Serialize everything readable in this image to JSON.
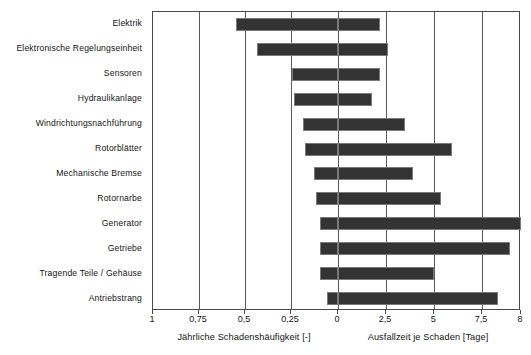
{
  "chart_data": {
    "type": "bar",
    "subtype": "bidirectional-horizontal-bar",
    "title": "",
    "categories": [
      "Elektrik",
      "Elektronische Regelungseinheit",
      "Sensoren",
      "Hydraulikanlage",
      "Windrichtungsnachführung",
      "Rotorblätter",
      "Mechanische Bremse",
      "Rotornarbe",
      "Generator",
      "Getriebe",
      "Tragende Teile / Gehäuse",
      "Antriebstrang"
    ],
    "series": [
      {
        "name": "Jährliche Schadenshäufigkeit [-]",
        "direction": "left",
        "axis_range": [
          1,
          0
        ],
        "axis_ticks": [
          1,
          0.75,
          0.5,
          0.25,
          0
        ],
        "axis_tick_labels": [
          "1",
          "0,75",
          "0,5",
          "0,25",
          "0"
        ],
        "values": [
          0.55,
          0.44,
          0.25,
          0.24,
          0.19,
          0.18,
          0.13,
          0.12,
          0.1,
          0.1,
          0.1,
          0.06
        ]
      },
      {
        "name": "Ausfallzeit je Schaden [Tage]",
        "direction": "right",
        "axis_range": [
          0,
          8
        ],
        "axis_ticks": [
          0,
          2.5,
          5,
          7.5,
          8
        ],
        "axis_tick_labels": [
          "0",
          "2,5",
          "5",
          "7,5",
          "8"
        ],
        "values": [
          1.85,
          2.2,
          1.85,
          1.5,
          2.95,
          5.0,
          3.3,
          4.5,
          8.4,
          7.5,
          4.2,
          7.0
        ]
      }
    ],
    "xlabel_left": "Jährliche Schadenshäufigkeit [-]",
    "xlabel_right": "Ausfallzeit je Schaden [Tage]",
    "ylabel": "",
    "grid": true,
    "gridlines_at": [
      1,
      0.75,
      0.5,
      0.25,
      0,
      2.5,
      5,
      7.5
    ],
    "legend": "none",
    "bar_color": "#333333",
    "frame_color": "#4a4a4a",
    "background": "#ffffff"
  },
  "axis": {
    "ticks": [
      {
        "label": "1",
        "pos": 0.0
      },
      {
        "label": "0,75",
        "pos": 12.5
      },
      {
        "label": "0,5",
        "pos": 25.0
      },
      {
        "label": "0,25",
        "pos": 37.5
      },
      {
        "label": "0",
        "pos": 50.3
      },
      {
        "label": "2,5",
        "pos": 63.3
      },
      {
        "label": "5",
        "pos": 76.4
      },
      {
        "label": "7,5",
        "pos": 89.4
      },
      {
        "label": "8",
        "pos": 100.0
      }
    ],
    "titles": [
      {
        "text": "Jährliche Schadenshäufigkeit [-]",
        "pos": 25.0
      },
      {
        "text": "Ausfallzeit je Schaden [Tage]",
        "pos": 75.0
      }
    ]
  }
}
